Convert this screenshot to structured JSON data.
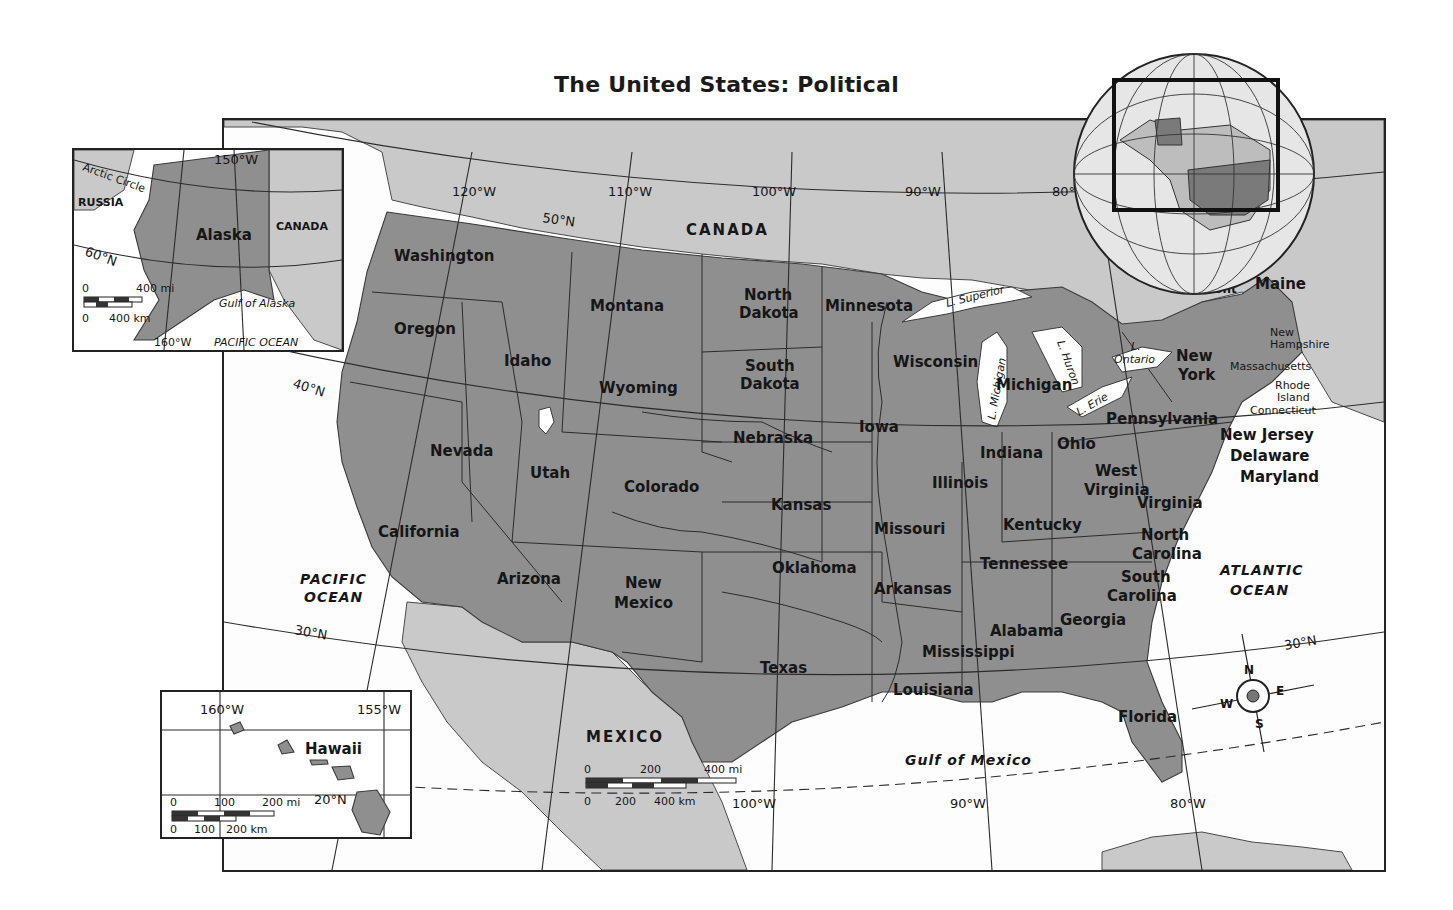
{
  "title": "The United States: Political",
  "countries": {
    "canada": "CANADA",
    "mexico": "MEXICO"
  },
  "oceans": {
    "pacific_line1": "PACIFIC",
    "pacific_line2": "OCEAN",
    "atlantic_line1": "ATLANTIC",
    "atlantic_line2": "OCEAN",
    "gulf": "Gulf of Mexico"
  },
  "lakes": {
    "superior": "L. Superior",
    "michigan": "L. Michigan",
    "huron": "L. Huron",
    "erie": "L. Erie",
    "ontario_1": "L.",
    "ontario_2": "Ontario"
  },
  "states": {
    "washington": "Washington",
    "oregon": "Oregon",
    "california": "California",
    "nevada": "Nevada",
    "idaho": "Idaho",
    "montana": "Montana",
    "wyoming": "Wyoming",
    "utah": "Utah",
    "arizona": "Arizona",
    "colorado": "Colorado",
    "new_mexico_1": "New",
    "new_mexico_2": "Mexico",
    "north_dakota_1": "North",
    "north_dakota_2": "Dakota",
    "south_dakota_1": "South",
    "south_dakota_2": "Dakota",
    "nebraska": "Nebraska",
    "kansas": "Kansas",
    "oklahoma": "Oklahoma",
    "texas": "Texas",
    "minnesota": "Minnesota",
    "iowa": "Iowa",
    "missouri": "Missouri",
    "arkansas": "Arkansas",
    "louisiana": "Louisiana",
    "wisconsin": "Wisconsin",
    "illinois": "Illinois",
    "michigan": "Michigan",
    "indiana": "Indiana",
    "ohio": "Ohio",
    "kentucky": "Kentucky",
    "tennessee": "Tennessee",
    "mississippi": "Mississippi",
    "alabama": "Alabama",
    "georgia": "Georgia",
    "florida": "Florida",
    "south_carolina_1": "South",
    "south_carolina_2": "Carolina",
    "north_carolina_1": "North",
    "north_carolina_2": "Carolina",
    "virginia": "Virginia",
    "west_virginia_1": "West",
    "west_virginia_2": "Virginia",
    "pennsylvania": "Pennsylvania",
    "new_york_1": "New",
    "new_york_2": "York",
    "vermont": "Vermont",
    "maine": "Maine",
    "new_hampshire_1": "New",
    "new_hampshire_2": "Hampshire",
    "massachusetts": "Massachusetts",
    "rhode_island_1": "Rhode",
    "rhode_island_2": "Island",
    "connecticut": "Connecticut",
    "new_jersey": "New Jersey",
    "delaware": "Delaware",
    "maryland": "Maryland"
  },
  "gridlines": {
    "lon_120": "120°W",
    "lon_110": "110°W",
    "lon_100_top": "100°W",
    "lon_90_top": "90°W",
    "lon_80_top": "80°",
    "lon_100_bottom": "100°W",
    "lon_90_bottom": "90°W",
    "lon_80_bottom": "80°W",
    "lat_50": "50°N",
    "lat_40": "40°N",
    "lat_30_left": "30°N",
    "lat_30_right": "30°N"
  },
  "scale_bar": {
    "mi_0": "0",
    "mi_200": "200",
    "mi_400": "400 mi",
    "km_0": "0",
    "km_200": "200",
    "km_400": "400 km"
  },
  "compass": {
    "n": "N",
    "s": "S",
    "e": "E",
    "w": "W"
  },
  "alaska_inset": {
    "label": "Alaska",
    "russia": "RUSSIA",
    "canada": "CANADA",
    "arctic_circle": "Arctic Circle",
    "lon_150": "150°W",
    "lon_160": "160°W",
    "lat_60": "60°N",
    "gulf": "Gulf of Alaska",
    "ocean": "PACIFIC  OCEAN",
    "scale_mi_0": "0",
    "scale_mi": "400 mi",
    "scale_km_0": "0",
    "scale_km": "400 km"
  },
  "hawaii_inset": {
    "label": "Hawaii",
    "lon_160": "160°W",
    "lon_155": "155°W",
    "lat_20": "20°N",
    "scale_mi_0": "0",
    "scale_mi_100": "100",
    "scale_mi_200": "200 mi",
    "scale_km_0": "0",
    "scale_km_100": "100",
    "scale_km_200": "200 km"
  },
  "colors": {
    "us_states": "#8f8f8f",
    "foreign_land": "#c9c9c9",
    "water": "#ffffff",
    "lines": "#2b2b2b"
  }
}
